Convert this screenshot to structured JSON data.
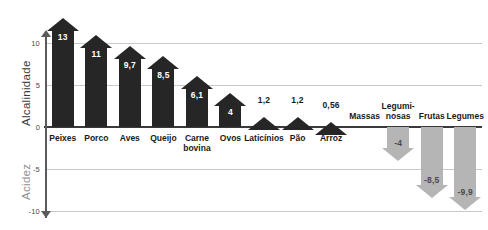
{
  "chart_data": {
    "type": "bar",
    "title": "",
    "subtitle": "",
    "xlabel": "",
    "ylabel_positive": "Alcalinidade",
    "ylabel_negative": "Acidez",
    "ylim": [
      -10,
      13
    ],
    "yticks": [
      "10",
      "5",
      "0",
      "-5",
      "-10"
    ],
    "ytick_values": [
      10,
      5,
      0,
      -5,
      -10
    ],
    "grid": true,
    "legend": "none",
    "decimal_separator": ",",
    "categories": [
      "Peixes",
      "Porco",
      "Aves",
      "Queijo",
      "Carne\nbovina",
      "Ovos",
      "Laticínios",
      "Pão",
      "Arroz",
      "Massas",
      "Legumi-\nnosas",
      "Frutas",
      "Legumes"
    ],
    "values": [
      13,
      11,
      9.7,
      8.5,
      6.1,
      4,
      1.2,
      1.2,
      0.56,
      0,
      -4,
      -8.5,
      -9.9
    ],
    "value_labels": [
      "13",
      "11",
      "9,7",
      "8,5",
      "6,1",
      "4",
      "1,2",
      "1,2",
      "0,56",
      "",
      "-4",
      "-8,5",
      "-9,9"
    ],
    "colors": {
      "positive_bar": "#262626",
      "negative_bar": "#b5b5b5",
      "gridline": "#c9c9c9",
      "zero_line": "#3a3a3a",
      "axis_line": "#5a5a5a",
      "positive_label_text": "#ffffff",
      "small_label_text": "#1a1a1a",
      "negative_label_text": "#4a4a4a",
      "alkalinity_title": "#3a3a3a",
      "acidity_title": "#8f8f8f",
      "background": "#ffffff"
    },
    "bars": [
      {
        "category": "Peixes",
        "label": "Peixes",
        "value": 13,
        "value_label": "13",
        "direction": "up",
        "label_side": "below",
        "label_pos": "inside"
      },
      {
        "category": "Porco",
        "label": "Porco",
        "value": 11,
        "value_label": "11",
        "direction": "up",
        "label_side": "below",
        "label_pos": "inside"
      },
      {
        "category": "Aves",
        "label": "Aves",
        "value": 9.7,
        "value_label": "9,7",
        "direction": "up",
        "label_side": "below",
        "label_pos": "inside"
      },
      {
        "category": "Queijo",
        "label": "Queijo",
        "value": 8.5,
        "value_label": "8,5",
        "direction": "up",
        "label_side": "below",
        "label_pos": "inside"
      },
      {
        "category": "Carne bovina",
        "label": "Carne\nbovina",
        "value": 6.1,
        "value_label": "6,1",
        "direction": "up",
        "label_side": "below",
        "label_pos": "inside"
      },
      {
        "category": "Ovos",
        "label": "Ovos",
        "value": 4,
        "value_label": "4",
        "direction": "up",
        "label_side": "below",
        "label_pos": "inside"
      },
      {
        "category": "Laticínios",
        "label": "Laticínios",
        "value": 1.2,
        "value_label": "1,2",
        "direction": "up",
        "label_side": "below",
        "label_pos": "above"
      },
      {
        "category": "Pão",
        "label": "Pão",
        "value": 1.2,
        "value_label": "1,2",
        "direction": "up",
        "label_side": "below",
        "label_pos": "above"
      },
      {
        "category": "Arroz",
        "label": "Arroz",
        "value": 0.56,
        "value_label": "0,56",
        "direction": "up",
        "label_side": "below",
        "label_pos": "above"
      },
      {
        "category": "Massas",
        "label": "Massas",
        "value": 0,
        "value_label": "",
        "direction": "none",
        "label_side": "above",
        "label_pos": "none"
      },
      {
        "category": "Leguminosas",
        "label": "Legumi-\nnosas",
        "value": -4,
        "value_label": "-4",
        "direction": "down",
        "label_side": "above",
        "label_pos": "inside"
      },
      {
        "category": "Frutas",
        "label": "Frutas",
        "value": -8.5,
        "value_label": "-8,5",
        "direction": "down",
        "label_side": "above",
        "label_pos": "inside"
      },
      {
        "category": "Legumes",
        "label": "Legumes",
        "value": -9.9,
        "value_label": "-9,9",
        "direction": "down",
        "label_side": "above",
        "label_pos": "inside"
      }
    ]
  }
}
